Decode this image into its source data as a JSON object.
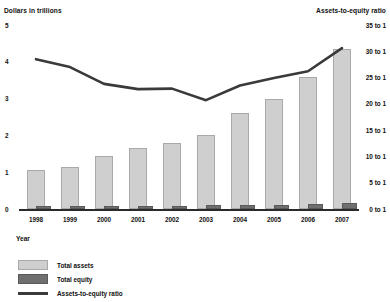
{
  "chart_data": {
    "type": "bar",
    "title": "",
    "subtitle": "",
    "xlabel": "Year",
    "ylabel": "Dollars in trillions",
    "y2label": "Assets-to-equity ratio",
    "grid": false,
    "legend_position": "bottom-left",
    "categories": [
      "1998",
      "1999",
      "2000",
      "2001",
      "2002",
      "2003",
      "2004",
      "2005",
      "2006",
      "2007"
    ],
    "ylim": [
      0,
      5
    ],
    "yticks": [
      "0",
      "1",
      "2",
      "3",
      "4",
      "5"
    ],
    "y2lim": [
      0,
      35
    ],
    "y2ticks": [
      "0 to 1",
      "5 to 1",
      "10 to 1",
      "15 to 1",
      "20 to 1",
      "25 to 1",
      "30 to 1",
      "35 to 1"
    ],
    "series": [
      {
        "name": "Total assets",
        "type": "bar",
        "axis": "left",
        "color": "#cfcfcf",
        "values": [
          1.05,
          1.15,
          1.45,
          1.65,
          1.78,
          2.0,
          2.6,
          3.0,
          3.6,
          4.35
        ]
      },
      {
        "name": "Total equity",
        "type": "bar",
        "axis": "left",
        "color": "#6f6f6f",
        "values": [
          0.07,
          0.07,
          0.08,
          0.09,
          0.09,
          0.1,
          0.11,
          0.12,
          0.14,
          0.15
        ]
      },
      {
        "name": "Assets-to-equity ratio",
        "type": "line",
        "axis": "right",
        "color": "#3a3a3a",
        "values": [
          28.5,
          27.0,
          23.8,
          22.8,
          22.9,
          20.7,
          23.5,
          24.9,
          26.2,
          30.6
        ]
      }
    ]
  },
  "legend": {
    "items": [
      {
        "label": "Total assets"
      },
      {
        "label": "Total equity"
      },
      {
        "label": "Assets-to-equity ratio"
      }
    ]
  }
}
